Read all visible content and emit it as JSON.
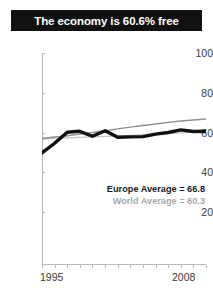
{
  "title": {
    "text": "The economy is 60.6% free"
  },
  "annotations": {
    "europe": "Europe Average = 66.8",
    "world": "World Average = 60.3"
  },
  "axis": {
    "x_start_label": "1995",
    "x_end_label": "2008",
    "y_ticks": [
      "100",
      "80",
      "60",
      "40",
      "20"
    ]
  },
  "colors": {
    "banner_background": "#111111",
    "banner_text": "#ffffff",
    "country_line": "#111111",
    "reference_line": "#8f8f8f",
    "axis": "#b8b8b8",
    "tick_text": "#3b3b3b",
    "world_annotation_text": "#a9a9a9"
  },
  "chart_data": {
    "type": "line",
    "title": "The economy is 60.6% free",
    "xlabel": "",
    "ylabel": "",
    "xlim": [
      1995,
      2008
    ],
    "ylim": [
      0,
      100
    ],
    "yticks": [
      20,
      40,
      60,
      80,
      100
    ],
    "xticks": [
      1995,
      1996,
      1997,
      1998,
      1999,
      2000,
      2001,
      2002,
      2003,
      2004,
      2005,
      2006,
      2007,
      2008
    ],
    "grid": false,
    "legend": "none",
    "x": [
      1995,
      1996,
      1997,
      1998,
      1999,
      2000,
      2001,
      2002,
      2003,
      2004,
      2005,
      2006,
      2007,
      2008
    ],
    "series": [
      {
        "name": "Country economic freedom score",
        "style": "thick-black",
        "values": [
          49.7,
          54.6,
          60.1,
          60.6,
          58.1,
          60.9,
          57.6,
          57.8,
          57.9,
          59.2,
          60.0,
          61.3,
          60.5,
          60.6
        ]
      },
      {
        "name": "Europe Average",
        "style": "thin-gray",
        "values": [
          57.0,
          57.7,
          58.4,
          59.2,
          60.0,
          60.9,
          61.8,
          62.7,
          63.5,
          64.3,
          65.1,
          65.8,
          66.3,
          66.8
        ]
      },
      {
        "name": "World Average",
        "style": "thin-light-gray",
        "values": [
          56.7,
          57.0,
          57.3,
          57.5,
          57.8,
          58.1,
          58.3,
          58.6,
          58.9,
          59.2,
          59.5,
          59.8,
          60.0,
          60.3
        ]
      }
    ],
    "reference_values": {
      "europe_average": 66.8,
      "world_average": 60.3,
      "country_latest": 60.6
    }
  }
}
